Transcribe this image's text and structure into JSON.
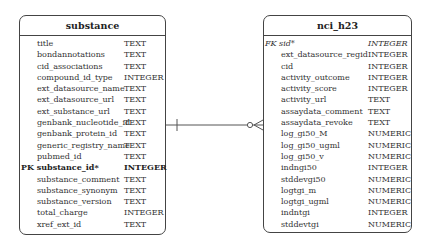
{
  "diagram": {
    "type": "entity-relationship",
    "tables": [
      {
        "name": "substance",
        "columns": [
          {
            "name": "title",
            "type": "TEXT",
            "key": ""
          },
          {
            "name": "bondannotations",
            "type": "TEXT",
            "key": ""
          },
          {
            "name": "cid_associations",
            "type": "TEXT",
            "key": ""
          },
          {
            "name": "compound_id_type",
            "type": "INTEGER",
            "key": ""
          },
          {
            "name": "ext_datasource_name",
            "type": "TEXT",
            "key": ""
          },
          {
            "name": "ext_datasource_url",
            "type": "TEXT",
            "key": ""
          },
          {
            "name": "ext_substance_url",
            "type": "TEXT",
            "key": ""
          },
          {
            "name": "genbank_nucleotide_id",
            "type": "TEXT",
            "key": ""
          },
          {
            "name": "genbank_protein_id",
            "type": "TEXT",
            "key": ""
          },
          {
            "name": "generic_registry_name",
            "type": "TEXT",
            "key": ""
          },
          {
            "name": "pubmed_id",
            "type": "TEXT",
            "key": ""
          },
          {
            "name": "PK substance_id*",
            "type": "INTEGER",
            "key": "PK"
          },
          {
            "name": "substance_comment",
            "type": "TEXT",
            "key": ""
          },
          {
            "name": "substance_synonym",
            "type": "TEXT",
            "key": ""
          },
          {
            "name": "substance_version",
            "type": "TEXT",
            "key": ""
          },
          {
            "name": "total_charge",
            "type": "INTEGER",
            "key": ""
          },
          {
            "name": "xref_ext_id",
            "type": "TEXT",
            "key": ""
          }
        ]
      },
      {
        "name": "nci_h23",
        "columns": [
          {
            "name": "FK sid*",
            "type": "INTEGER",
            "key": "FK"
          },
          {
            "name": "ext_datasource_regid",
            "type": "INTEGER",
            "key": ""
          },
          {
            "name": "cid",
            "type": "INTEGER",
            "key": ""
          },
          {
            "name": "activity_outcome",
            "type": "INTEGER",
            "key": ""
          },
          {
            "name": "activity_score",
            "type": "INTEGER",
            "key": ""
          },
          {
            "name": "activity_url",
            "type": "TEXT",
            "key": ""
          },
          {
            "name": "assaydata_comment",
            "type": "TEXT",
            "key": ""
          },
          {
            "name": "assaydata_revoke",
            "type": "TEXT",
            "key": ""
          },
          {
            "name": "log_gi50_M",
            "type": "NUMERIC",
            "key": ""
          },
          {
            "name": "log_gi50_ugml",
            "type": "NUMERIC",
            "key": ""
          },
          {
            "name": "log_gi50_v",
            "type": "NUMERIC",
            "key": ""
          },
          {
            "name": "indngi50",
            "type": "INTEGER",
            "key": ""
          },
          {
            "name": "stddevgi50",
            "type": "NUMERIC",
            "key": ""
          },
          {
            "name": "logtgi_m",
            "type": "NUMERIC",
            "key": ""
          },
          {
            "name": "logtgi_ugml",
            "type": "NUMERIC",
            "key": ""
          },
          {
            "name": "indntgi",
            "type": "INTEGER",
            "key": ""
          },
          {
            "name": "stddevtgi",
            "type": "NUMERIC",
            "key": ""
          }
        ]
      }
    ],
    "relationship": {
      "from": "substance",
      "to": "nci_h23",
      "from_cardinality": "one",
      "to_cardinality": "zero-or-many"
    },
    "colors": {
      "border": "#444444",
      "line": "#555555",
      "text": "#333333"
    }
  }
}
